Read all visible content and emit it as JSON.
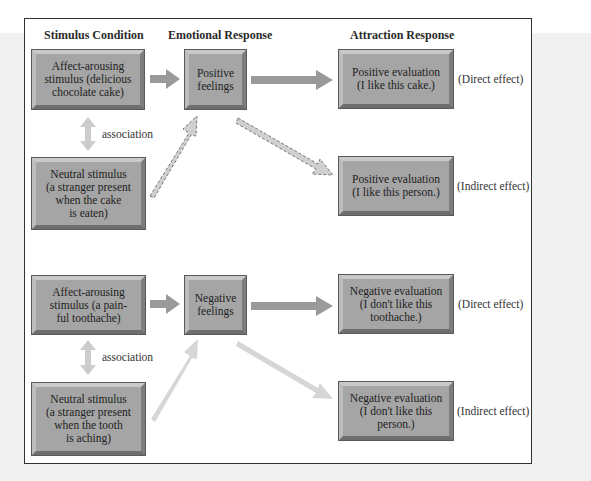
{
  "headers": {
    "stimulus": "Stimulus Condition",
    "emotional": "Emotional Response",
    "attraction": "Attraction Response"
  },
  "positive_example": {
    "affect_stimulus": "Affect-arousing\nstimulus (delicious\nchocolate cake)",
    "feeling": "Positive\nfeelings",
    "direct_evaluation": "Positive evaluation\n(I like this cake.)",
    "neutral_stimulus": "Neutral stimulus\n(a stranger present\nwhen the cake\nis eaten)",
    "indirect_evaluation": "Positive evaluation\n(I like this person.)",
    "association_label": "association",
    "direct_effect_label": "(Direct effect)",
    "indirect_effect_label": "(Indirect effect)"
  },
  "negative_example": {
    "affect_stimulus": "Affect-arousing\nstimulus (a pain-\nful toothache)",
    "feeling": "Negative\nfeelings",
    "direct_evaluation": "Negative evaluation\n(I don't like this\ntoothache.)",
    "neutral_stimulus": "Neutral stimulus\n(a stranger present\nwhen the tooth\nis aching)",
    "indirect_evaluation": "Negative evaluation\n(I don't like this\nperson.)",
    "association_label": "association",
    "direct_effect_label": "(Direct effect)",
    "indirect_effect_label": "(Indirect effect)"
  },
  "colors": {
    "box_fill": "#a5a5a5",
    "solid_arrow": "#9a9a9a",
    "light_arrow": "#d2d2d2",
    "dashed_arrow_fill": "#c8c8c8",
    "frame_border": "#333333",
    "background_panel": "#f1f1f1"
  }
}
